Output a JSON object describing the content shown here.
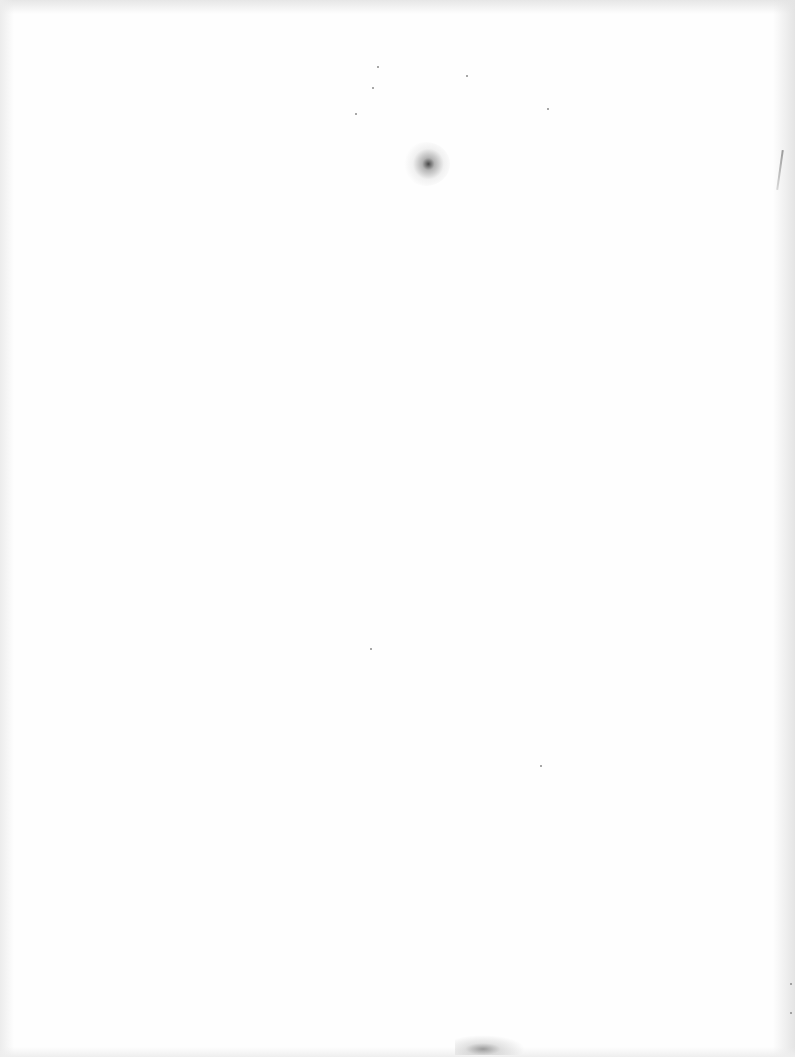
{
  "document": {
    "type": "scanned-page",
    "content": "",
    "is_blank": true
  },
  "colors": {
    "paper": "#fefefe",
    "edge_shadow": "#e6e6e6",
    "smudge": "#3a3a3a"
  },
  "artifacts": {
    "specks": [
      {
        "x": 377,
        "y": 66
      },
      {
        "x": 466,
        "y": 75
      },
      {
        "x": 372,
        "y": 87
      },
      {
        "x": 355,
        "y": 113
      },
      {
        "x": 547,
        "y": 108
      },
      {
        "x": 370,
        "y": 648
      },
      {
        "x": 540,
        "y": 765
      },
      {
        "x": 790,
        "y": 983
      },
      {
        "x": 790,
        "y": 1012
      }
    ]
  }
}
